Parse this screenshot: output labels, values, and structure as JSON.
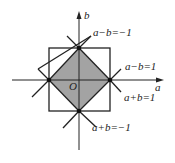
{
  "diagram": {
    "axes": {
      "x_label": "a",
      "y_label": "b",
      "origin_label": "O"
    },
    "lines": [
      {
        "id": "line-a-minus-b-neg1",
        "label": "a−b=−1"
      },
      {
        "id": "line-a-minus-b-1",
        "label": "a−b=1"
      },
      {
        "id": "line-a-plus-b-1",
        "label": "a+b=1"
      },
      {
        "id": "line-a-plus-b-neg1",
        "label": "a+b=−1"
      }
    ],
    "region": {
      "description": "shaded square region |a|+|b|≤1",
      "fill": "#a3a3a3"
    },
    "bounding_square": {
      "description": "square -1≤a≤1, -1≤b≤1"
    },
    "vertices": [
      {
        "name": "top",
        "coords": "(0,1)"
      },
      {
        "name": "right",
        "coords": "(1,0)"
      },
      {
        "name": "bottom",
        "coords": "(0,-1)"
      },
      {
        "name": "left",
        "coords": "(-1,0)"
      }
    ],
    "colors": {
      "stroke": "#222222",
      "fill": "#a3a3a3",
      "background": "#ffffff"
    }
  }
}
